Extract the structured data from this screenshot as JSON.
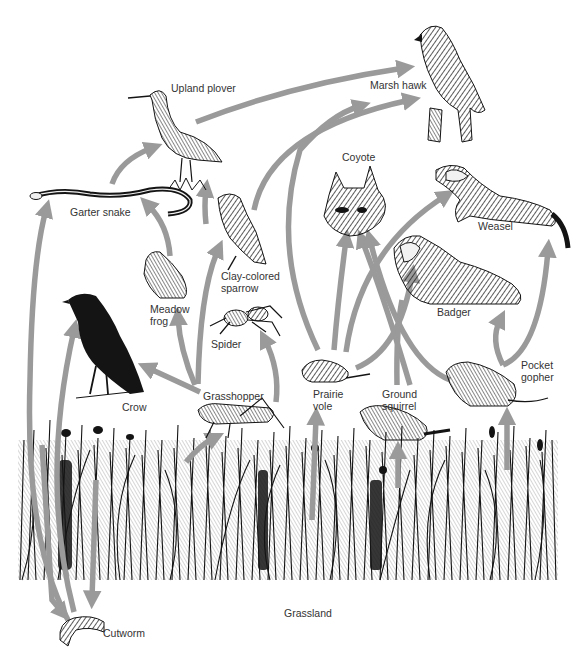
{
  "diagram": {
    "arrow_color": "#9a9a9a",
    "ink_color": "#141414",
    "background": "#ffffff",
    "nodes": {
      "upland_plover": {
        "label": "Upland plover",
        "x": 172,
        "y": 88
      },
      "marsh_hawk": {
        "label": "Marsh hawk",
        "x": 370,
        "y": 79
      },
      "garter_snake": {
        "label": "Garter snake",
        "x": 70,
        "y": 205
      },
      "coyote": {
        "label": "Coyote",
        "x": 342,
        "y": 152
      },
      "weasel": {
        "label": "Weasel",
        "x": 478,
        "y": 220
      },
      "clay_colored_sparrow": {
        "label": "Clay-colored\nsparrow",
        "x": 221,
        "y": 268
      },
      "meadow_frog": {
        "label": "Meadow\nfrog",
        "x": 150,
        "y": 305
      },
      "badger": {
        "label": "Badger",
        "x": 437,
        "y": 307
      },
      "spider": {
        "label": "Spider",
        "x": 210,
        "y": 338
      },
      "crow": {
        "label": "Crow",
        "x": 122,
        "y": 402
      },
      "grasshopper": {
        "label": "Grasshopper",
        "x": 202,
        "y": 391
      },
      "prairie_vole": {
        "label": "Prairie\nvole",
        "x": 313,
        "y": 388
      },
      "ground_squirrel": {
        "label": "Ground\nsquirrel",
        "x": 382,
        "y": 389
      },
      "pocket_gopher": {
        "label": "Pocket\ngopher",
        "x": 521,
        "y": 359
      },
      "grassland": {
        "label": "Grassland",
        "x": 284,
        "y": 607
      },
      "cutworm": {
        "label": "Cutworm",
        "x": 103,
        "y": 626
      }
    },
    "links": [
      {
        "from": "grassland",
        "to": "cutworm"
      },
      {
        "from": "grassland",
        "to": "grasshopper"
      },
      {
        "from": "grassland",
        "to": "prairie_vole"
      },
      {
        "from": "grassland",
        "to": "ground_squirrel"
      },
      {
        "from": "grassland",
        "to": "pocket_gopher"
      },
      {
        "from": "cutworm",
        "to": "garter_snake"
      },
      {
        "from": "cutworm",
        "to": "crow"
      },
      {
        "from": "grasshopper",
        "to": "crow"
      },
      {
        "from": "grasshopper",
        "to": "meadow_frog"
      },
      {
        "from": "grasshopper",
        "to": "clay_colored_sparrow"
      },
      {
        "from": "grasshopper",
        "to": "spider"
      },
      {
        "from": "meadow_frog",
        "to": "garter_snake"
      },
      {
        "from": "garter_snake",
        "to": "upland_plover"
      },
      {
        "from": "clay_colored_sparrow",
        "to": "upland_plover"
      },
      {
        "from": "upland_plover",
        "to": "marsh_hawk"
      },
      {
        "from": "clay_colored_sparrow",
        "to": "marsh_hawk"
      },
      {
        "from": "prairie_vole",
        "to": "marsh_hawk"
      },
      {
        "from": "prairie_vole",
        "to": "coyote"
      },
      {
        "from": "prairie_vole",
        "to": "weasel"
      },
      {
        "from": "prairie_vole",
        "to": "badger"
      },
      {
        "from": "ground_squirrel",
        "to": "badger"
      },
      {
        "from": "ground_squirrel",
        "to": "coyote"
      },
      {
        "from": "pocket_gopher",
        "to": "badger"
      },
      {
        "from": "pocket_gopher",
        "to": "weasel"
      },
      {
        "from": "pocket_gopher",
        "to": "coyote"
      }
    ]
  }
}
